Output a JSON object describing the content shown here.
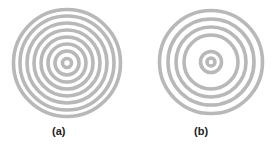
{
  "figures": [
    {
      "id": "a",
      "label": "(a)",
      "center": [
        67,
        63
      ],
      "ring_color": "#b8b8b8",
      "ring_width": 3.6,
      "rings": [
        4.5,
        12,
        19,
        26,
        33,
        40,
        47,
        53.5
      ],
      "description": "Concentric rings with uniform spacing"
    },
    {
      "id": "b",
      "label": "(b)",
      "center": [
        211,
        62
      ],
      "ring_color": "#b8b8b8",
      "ring_width": 3.6,
      "rings": [
        4,
        10.5,
        27,
        35,
        43,
        51.5
      ],
      "description": "Concentric rings with a wide gap between inner and outer rings"
    }
  ],
  "background_color": "#ffffff"
}
